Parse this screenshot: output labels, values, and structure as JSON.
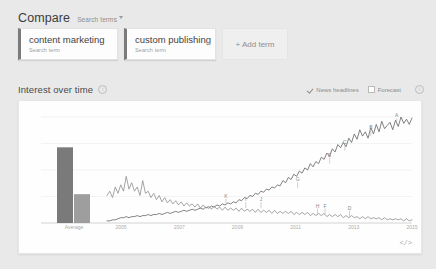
{
  "compare": {
    "title": "Compare",
    "subtitle": "Search terms",
    "caret_icon": "chevron-down-icon",
    "terms": [
      {
        "term": "content marketing",
        "label": "Search term",
        "remove_icon": "close-icon"
      },
      {
        "term": "custom publishing",
        "label": "Search term",
        "remove_icon": "close-icon"
      }
    ],
    "add_term_label": "+ Add term"
  },
  "interest": {
    "title": "Interest over time",
    "info_icon": "info-icon",
    "info_glyph": "i",
    "options": [
      {
        "label": "News headlines",
        "checked": true,
        "icon": "check-icon"
      },
      {
        "label": "Forecast",
        "checked": false,
        "icon": "checkbox-icon"
      }
    ],
    "forecast_info_icon": "info-icon",
    "forecast_info_glyph": "i",
    "embed_label": "</>",
    "embed_icon": "embed-code-icon"
  },
  "chart_data": {
    "type": "line",
    "title": "Interest over time",
    "xlabel": "",
    "ylabel": "",
    "ylim": [
      0,
      100
    ],
    "grid": true,
    "legend_position": "none",
    "average_label": "Average",
    "averages": [
      {
        "name": "content marketing",
        "value": 21
      },
      {
        "name": "custom publishing",
        "value": 8
      }
    ],
    "x_ticks": [
      "2005",
      "2007",
      "2009",
      "2011",
      "2013",
      "2015"
    ],
    "series": [
      {
        "name": "content marketing",
        "color": "#6b6b6b",
        "values": [
          2,
          2,
          3,
          3,
          4,
          5,
          5,
          6,
          5,
          6,
          6,
          7,
          6,
          7,
          7,
          8,
          7,
          8,
          8,
          9,
          8,
          9,
          10,
          9,
          10,
          11,
          10,
          11,
          12,
          11,
          12,
          13,
          12,
          13,
          14,
          13,
          15,
          14,
          16,
          15,
          17,
          16,
          18,
          17,
          19,
          18,
          20,
          19,
          22,
          21,
          24,
          23,
          26,
          25,
          28,
          27,
          30,
          29,
          32,
          31,
          34,
          33,
          36,
          35,
          40,
          38,
          43,
          41,
          46,
          44,
          49,
          47,
          52,
          50,
          56,
          53,
          58,
          56,
          62,
          60,
          66,
          63,
          70,
          67,
          74,
          71,
          76,
          72,
          80,
          76,
          84,
          79,
          88,
          82,
          86,
          80,
          90,
          84,
          93,
          86,
          96,
          89,
          92,
          95,
          88,
          97,
          91,
          100,
          94,
          98,
          93,
          99
        ]
      },
      {
        "name": "custom publishing",
        "color": "#959595",
        "values": [
          26,
          30,
          24,
          34,
          28,
          36,
          30,
          44,
          32,
          38,
          30,
          34,
          26,
          40,
          28,
          30,
          24,
          28,
          22,
          26,
          20,
          24,
          19,
          22,
          18,
          21,
          17,
          20,
          16,
          19,
          16,
          18,
          15,
          18,
          14,
          17,
          14,
          16,
          13,
          16,
          13,
          15,
          12,
          15,
          12,
          14,
          12,
          14,
          11,
          14,
          11,
          13,
          11,
          13,
          10,
          13,
          10,
          12,
          10,
          12,
          9,
          12,
          9,
          11,
          9,
          11,
          9,
          11,
          8,
          10,
          8,
          10,
          8,
          10,
          7,
          9,
          7,
          9,
          7,
          9,
          6,
          8,
          6,
          8,
          6,
          8,
          5,
          7,
          5,
          7,
          5,
          6,
          4,
          6,
          4,
          6,
          4,
          5,
          4,
          5,
          3,
          5,
          3,
          4,
          3,
          4,
          3,
          4,
          2,
          4,
          2,
          3
        ]
      }
    ],
    "news_markers": [
      {
        "letter": "K",
        "x_pct": 39.0,
        "series": 1,
        "value": 17
      },
      {
        "letter": "J",
        "x_pct": 50.5,
        "series": 1,
        "value": 14
      },
      {
        "letter": "G",
        "x_pct": 62.5,
        "series": 0,
        "value": 33
      },
      {
        "letter": "I",
        "x_pct": 45.5,
        "series": 1,
        "value": 14
      },
      {
        "letter": "E",
        "x_pct": 73.0,
        "series": 0,
        "value": 56
      },
      {
        "letter": "C",
        "x_pct": 78.0,
        "series": 0,
        "value": 68
      },
      {
        "letter": "B",
        "x_pct": 86.5,
        "series": 0,
        "value": 82
      },
      {
        "letter": "A",
        "x_pct": 95.0,
        "series": 0,
        "value": 93
      },
      {
        "letter": "H",
        "x_pct": 69.0,
        "series": 1,
        "value": 8
      },
      {
        "letter": "F",
        "x_pct": 71.5,
        "series": 1,
        "value": 8
      },
      {
        "letter": "D",
        "x_pct": 79.5,
        "series": 1,
        "value": 6
      }
    ]
  }
}
